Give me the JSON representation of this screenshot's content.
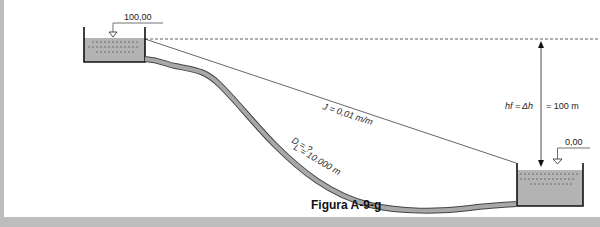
{
  "figure": {
    "caption": "Figura A-9-g",
    "upper_reservoir": {
      "level_label": "100,00"
    },
    "lower_reservoir": {
      "level_label": "0,00"
    },
    "pipe": {
      "diameter_label": "D = ?",
      "length_label": "L = 10.000 m"
    },
    "energy_line": {
      "slope_label": "J = 0,01 m/m"
    },
    "head_loss": {
      "label_left": "hf = ",
      "label_mid": "Δh",
      "label_right": "= 100 m"
    }
  },
  "colors": {
    "water": "#b3b3b3",
    "pipe": "#a8a8a8",
    "frame": "#bdbdbd",
    "line": "#222222"
  }
}
